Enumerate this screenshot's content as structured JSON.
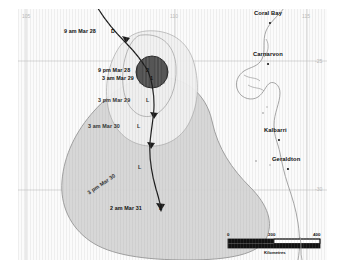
{
  "map": {
    "title": "Tropical Cyclone Forecast Track Map",
    "region": "Western Australia coast",
    "background_color": "#fbfbfb",
    "frame_color": "#ffffff"
  },
  "graticule": {
    "longitude_labels": [
      {
        "text": "105",
        "x": 18,
        "y": 13
      },
      {
        "text": "110",
        "x": 167,
        "y": 13
      },
      {
        "text": "115",
        "x": 299,
        "y": 13
      }
    ],
    "latitude_labels": [
      {
        "text": "-25",
        "x": 315,
        "y": 61
      },
      {
        "text": "-30",
        "x": 315,
        "y": 188
      }
    ],
    "line_color": "#c8c8c8"
  },
  "coastline": {
    "color": "#9a9a9a",
    "label": "coastline"
  },
  "cities": [
    {
      "name": "Coral Bay",
      "label_x": 254,
      "label_y": 13,
      "dot_x": 252,
      "dot_y": 17
    },
    {
      "name": "Carnarvon",
      "label_x": 253,
      "label_y": 55,
      "dot_x": 250,
      "dot_y": 59
    },
    {
      "name": "Kalbarri",
      "label_x": 264,
      "label_y": 133,
      "dot_x": 261,
      "dot_y": 137
    },
    {
      "name": "Geraldton",
      "label_x": 272,
      "label_y": 160,
      "dot_x": 270,
      "dot_y": 164
    }
  ],
  "track_labels": [
    {
      "text": "9 am Mar 28",
      "intensity": "D",
      "x": 64,
      "y": 29,
      "rotated": false
    },
    {
      "text": "9 pm Mar 28",
      "intensity": "2",
      "x": 98,
      "y": 69,
      "rotated": false
    },
    {
      "text": "3 am Mar 29",
      "intensity": "1",
      "x": 102,
      "y": 77,
      "rotated": false
    },
    {
      "text": "3 pm Mar 29",
      "intensity": "L",
      "x": 99,
      "y": 99,
      "rotated": false
    },
    {
      "text": "3 am Mar 30",
      "intensity": "L",
      "x": 89,
      "y": 125,
      "rotated": false
    },
    {
      "text": "3 pm Mar 30",
      "intensity": "L",
      "x": 88,
      "y": 189,
      "rotated": true
    },
    {
      "text": "2 am Mar 31",
      "intensity": "L",
      "x": 110,
      "y": 206,
      "rotated": false
    }
  ],
  "legend_symbols": {
    "D": "Tropical low / depression",
    "1": "Category 1",
    "2": "Category 2",
    "L": "Low"
  },
  "uncertainty": {
    "inner_zone_color": "#f2f2f2",
    "outer_zone_color": "#d6d6d6",
    "outline_color": "#8c8c8c",
    "eye_color": "#4a4a4a"
  },
  "scale_bar": {
    "ticks": [
      "0",
      "200",
      "400"
    ],
    "unit": "Kilometres",
    "x": 228,
    "y": 237,
    "width": 92
  }
}
